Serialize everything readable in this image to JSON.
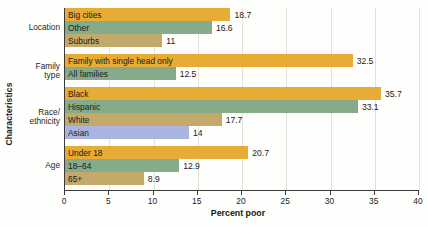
{
  "chart_data": {
    "type": "bar",
    "orientation": "horizontal",
    "title": "",
    "xlabel": "Percent poor",
    "ylabel": "Characteristics",
    "xlim": [
      0,
      40
    ],
    "xticks": [
      0,
      5,
      10,
      15,
      20,
      25,
      30,
      35,
      40
    ],
    "grid": true,
    "legend": "none",
    "groups": [
      {
        "name": "Location",
        "bars": [
          {
            "label": "Big cities",
            "value": 18.7,
            "value_text": "18.7",
            "color": "#e8ab35"
          },
          {
            "label": "Other",
            "value": 16.6,
            "value_text": "16.6",
            "color": "#86ab8a"
          },
          {
            "label": "Suburbs",
            "value": 11,
            "value_text": "11",
            "color": "#c3a96a"
          }
        ]
      },
      {
        "name": "Family type",
        "bars": [
          {
            "label": "Family with single head only",
            "value": 32.5,
            "value_text": "32.5",
            "color": "#e8ab35"
          },
          {
            "label": "All families",
            "value": 12.5,
            "value_text": "12.5",
            "color": "#86ab8a"
          }
        ]
      },
      {
        "name": "Race/ ethnicity",
        "bars": [
          {
            "label": "Black",
            "value": 35.7,
            "value_text": "35.7",
            "color": "#e8ab35"
          },
          {
            "label": "Hispanic",
            "value": 33.1,
            "value_text": "33.1",
            "color": "#86ab8a"
          },
          {
            "label": "White",
            "value": 17.7,
            "value_text": "17.7",
            "color": "#c3a96a"
          },
          {
            "label": "Asian",
            "value": 14,
            "value_text": "14",
            "color": "#a9b4e0"
          }
        ]
      },
      {
        "name": "Age",
        "bars": [
          {
            "label": "Under 18",
            "value": 20.7,
            "value_text": "20.7",
            "color": "#e8ab35"
          },
          {
            "label": "18–64",
            "value": 12.9,
            "value_text": "12.9",
            "color": "#86ab8a"
          },
          {
            "label": "65+",
            "value": 8.9,
            "value_text": "8.9",
            "color": "#c3a96a"
          }
        ]
      }
    ]
  }
}
